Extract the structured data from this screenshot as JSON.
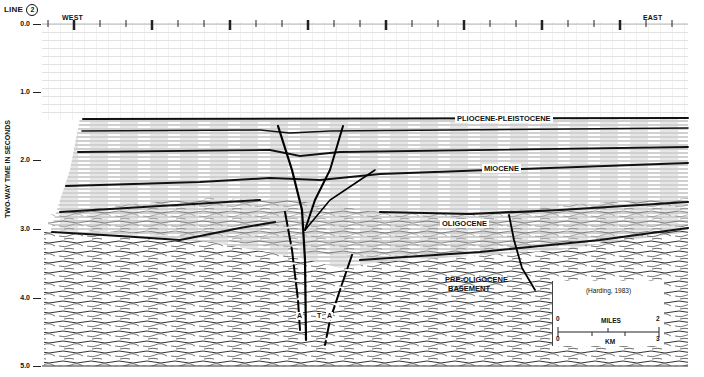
{
  "figure": {
    "line_label": "LINE",
    "line_number": "2",
    "west_label": "WEST",
    "east_label": "EAST",
    "y_axis_title": "TWO-WAY TIME IN SECONDS",
    "y_ticks": [
      "0.0",
      "1.0",
      "2.0",
      "3.0",
      "4.0",
      "5.0"
    ],
    "y_range_seconds": [
      0.0,
      5.0
    ],
    "units": [
      {
        "id": "pliocene-pleistocene",
        "label": "PLIOCENE-PLEISTOCENE"
      },
      {
        "id": "miocene",
        "label": "MIOCENE"
      },
      {
        "id": "oligocene",
        "label": "OLIGOCENE"
      },
      {
        "id": "basement-1",
        "label": "PRE-OLIGOCENE"
      },
      {
        "id": "basement-2",
        "label": "BASEMENT"
      }
    ],
    "fault_labels": [
      "A",
      "T",
      "A"
    ],
    "citation": "(Harding, 1983)",
    "scale_bar": {
      "miles_label": "MILES",
      "miles_min": "0",
      "miles_max": "2",
      "km_label": "KM",
      "km_min": "0",
      "km_max": "3"
    },
    "colors": {
      "ink": "#111111",
      "paper": "#ffffff",
      "grid": "#c8c8c8",
      "noise": "#555555"
    }
  }
}
